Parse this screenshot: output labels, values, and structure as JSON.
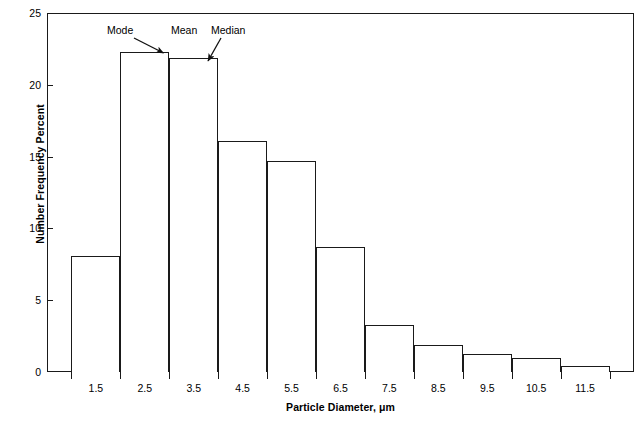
{
  "chart_data": {
    "type": "bar",
    "title": "",
    "subtitle": "",
    "xlabel": "Particle Diameter, μm",
    "ylabel": "Number Frequency Percent",
    "categories": [
      "1.5",
      "2.5",
      "3.5",
      "4.5",
      "5.5",
      "6.5",
      "7.5",
      "8.5",
      "9.5",
      "10.5",
      "11.5"
    ],
    "values": [
      8.1,
      22.3,
      21.9,
      16.1,
      14.7,
      8.7,
      3.3,
      1.9,
      1.25,
      1.0,
      0.4
    ],
    "xlim": [
      0.5,
      12.5
    ],
    "ylim": [
      0,
      25
    ],
    "ytick_labels": [
      "0",
      "5",
      "10",
      "15",
      "20",
      "25"
    ],
    "ytick_values": [
      0,
      5,
      10,
      15,
      20,
      25
    ],
    "xtick_labels": [
      "1.5",
      "2.5",
      "3.5",
      "4.5",
      "5.5",
      "6.5",
      "7.5",
      "8.5",
      "9.5",
      "10.5",
      "11.5"
    ],
    "grid": false,
    "legend": null,
    "bar_style": {
      "fill": "#ffffff",
      "edge": "#1a1a1a"
    },
    "annotations": [
      {
        "text": "Mode",
        "points_to_category": "2.5",
        "points_to_value": 22.3
      },
      {
        "text": "Mean",
        "points_to_category": "2.5",
        "points_to_value": 22.3
      },
      {
        "text": "Median",
        "points_to_category": "3.5",
        "points_to_value": 21.9
      }
    ]
  },
  "axes": {
    "y_title": "Number Frequency Percent",
    "x_title": "Particle Diameter, μm",
    "y_ticks": [
      {
        "label": "25",
        "value": 25
      },
      {
        "label": "20",
        "value": 20
      },
      {
        "label": "15",
        "value": 15
      },
      {
        "label": "10",
        "value": 10
      },
      {
        "label": "5",
        "value": 5
      },
      {
        "label": "0",
        "value": 0
      }
    ],
    "x_ticks": [
      {
        "label": "1.5"
      },
      {
        "label": "2.5"
      },
      {
        "label": "3.5"
      },
      {
        "label": "4.5"
      },
      {
        "label": "5.5"
      },
      {
        "label": "6.5"
      },
      {
        "label": "7.5"
      },
      {
        "label": "8.5"
      },
      {
        "label": "9.5"
      },
      {
        "label": "10.5"
      },
      {
        "label": "11.5"
      }
    ]
  },
  "annotations": {
    "mode": "Mode",
    "mean": "Mean",
    "median": "Median"
  },
  "colors": {
    "axis": "#1a1a1a",
    "bar_edge": "#1a1a1a",
    "bar_fill": "#ffffff",
    "text": "#000000",
    "background": "#ffffff"
  }
}
